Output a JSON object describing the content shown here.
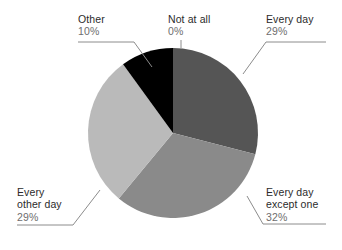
{
  "chart_data": {
    "type": "pie",
    "title": "",
    "subtitle": "",
    "xlabel": "",
    "ylabel": "",
    "legend_position": "callout-labels",
    "grid": false,
    "categories": [
      "Every day",
      "Every day except one",
      "Every other day",
      "Other",
      "Not at all"
    ],
    "values": [
      29,
      32,
      29,
      10,
      0
    ],
    "value_unit": "%",
    "value_labels": [
      "29%",
      "32%",
      "29%",
      "10%",
      "0%"
    ],
    "start_angle_deg": 0,
    "direction": "clockwise",
    "colors": [
      "#555555",
      "#8a8a8a",
      "#bababa",
      "#000000",
      "#ffffff"
    ],
    "slices": [
      {
        "label": "Every day",
        "value": 29,
        "value_label": "29%",
        "color": "#555555",
        "start_deg": 0.0,
        "end_deg": 104.4
      },
      {
        "label": "Every day except one",
        "value": 32,
        "value_label": "32%",
        "color": "#8a8a8a",
        "start_deg": 104.4,
        "end_deg": 219.6
      },
      {
        "label": "Every other day",
        "value": 29,
        "value_label": "29%",
        "color": "#bababa",
        "start_deg": 219.6,
        "end_deg": 324.0
      },
      {
        "label": "Other",
        "value": 10,
        "value_label": "10%",
        "color": "#000000",
        "start_deg": 324.0,
        "end_deg": 360.0
      },
      {
        "label": "Not at all",
        "value": 0,
        "value_label": "0%",
        "color": "#ffffff",
        "start_deg": 360.0,
        "end_deg": 360.0
      }
    ]
  },
  "labels": {
    "other": {
      "category": "Other",
      "percent": "10%"
    },
    "not_at_all": {
      "category": "Not at all",
      "percent": "0%"
    },
    "every_day": {
      "category": "Every day",
      "percent": "29%"
    },
    "except_one": {
      "category": "Every day",
      "category2": "except one",
      "percent": "32%"
    },
    "other_day": {
      "category": "Every",
      "category2": "other day",
      "percent": "29%"
    }
  },
  "style": {
    "leader_line_color": "#8c8c8c",
    "background": "#ffffff",
    "category_text_color": "#2b2b2b",
    "percent_text_color": "#6e6e6e"
  }
}
